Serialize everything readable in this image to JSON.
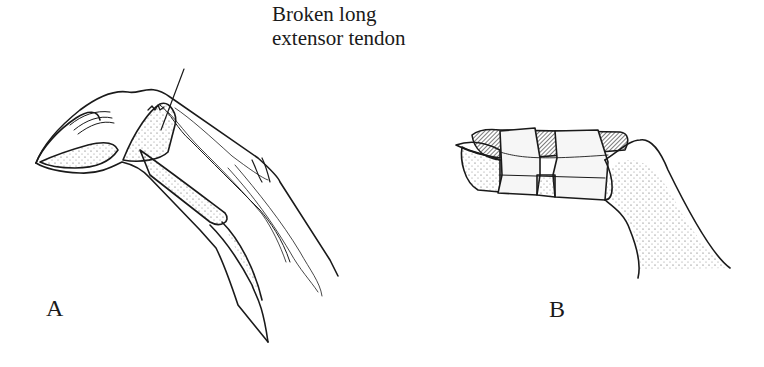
{
  "figure": {
    "annotation": {
      "line1": "Broken long",
      "line2": "extensor tendon"
    },
    "panels": [
      {
        "letter": "A",
        "depicts": "finger with broken long extensor tendon, tip drooping"
      },
      {
        "letter": "B",
        "depicts": "finger fingertip splinted with tape"
      }
    ],
    "colors": {
      "ink": "#1a1a1a",
      "background": "#ffffff",
      "tape": "#f4f4f4"
    }
  }
}
